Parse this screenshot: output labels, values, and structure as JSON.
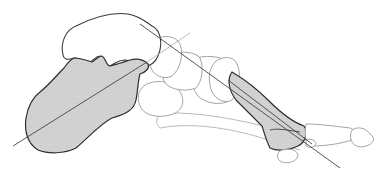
{
  "figure": {
    "colors": {
      "background": "#ffffff",
      "outline_light": "#9a9a9a",
      "outline_dark": "#3a3a3a",
      "stipple_dot": "#8c8c8c",
      "stipple_bg": "#e4e4e4",
      "axis_line": "#444444"
    },
    "structures": [
      {
        "name": "talus",
        "shaded": false
      },
      {
        "name": "calcaneus",
        "shaded": true
      },
      {
        "name": "navicular",
        "shaded": false
      },
      {
        "name": "cuneiform",
        "shaded": false
      },
      {
        "name": "cuboid",
        "shaded": false
      },
      {
        "name": "fifth-metatarsal",
        "shaded": false
      },
      {
        "name": "first-metatarsal",
        "shaded": true
      },
      {
        "name": "proximal-phalanx",
        "shaded": false
      },
      {
        "name": "distal-phalanx",
        "shaded": false
      },
      {
        "name": "sesamoid",
        "shaded": false
      }
    ],
    "axes": [
      {
        "name": "calcaneal-axis"
      },
      {
        "name": "talar-first-metatarsal-axis"
      },
      {
        "name": "first-metatarsal-axis"
      }
    ]
  }
}
